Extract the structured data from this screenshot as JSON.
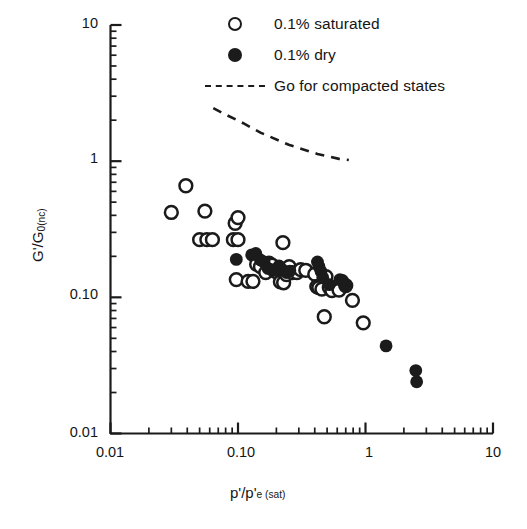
{
  "legend": {
    "position": "top-center",
    "items": [
      {
        "key": "open-circle",
        "label": "0.1% saturated"
      },
      {
        "key": "filled-circle",
        "label": "0.1% dry"
      },
      {
        "key": "dashed-line",
        "label": "Go for compacted states"
      }
    ]
  },
  "axes": {
    "y": {
      "label_html": "G'/G<sub>0(nc)</sub>",
      "label_plain": "G'/G0(nc)",
      "scale": "log",
      "min": 0.01,
      "max": 10,
      "tick_labels": [
        "10",
        "1",
        "0.10",
        "0.01"
      ],
      "tick_values": [
        10,
        1,
        0.1,
        0.01
      ]
    },
    "x": {
      "label_html": "p'/p'<sub>e (sat)</sub>",
      "label_plain": "p'/p'e (sat)",
      "scale": "log",
      "min": 0.01,
      "max": 10,
      "tick_labels": [
        "0.01",
        "0.10",
        "1",
        "10"
      ],
      "tick_values": [
        0.01,
        0.1,
        1,
        10
      ]
    }
  },
  "colors": {
    "axis": "#1b1b1b",
    "marker": "#1b1b1b",
    "background": "#ffffff"
  },
  "chart_data": {
    "type": "scatter",
    "title": "",
    "xlabel": "p'/p'e (sat)",
    "ylabel": "G'/G0(nc)",
    "xscale": "log",
    "yscale": "log",
    "xlim": [
      0.01,
      10
    ],
    "ylim": [
      0.01,
      10
    ],
    "grid": false,
    "legend_position": "top-center",
    "series": [
      {
        "name": "0.1% saturated",
        "marker": "open-circle",
        "points": [
          [
            0.03,
            0.42
          ],
          [
            0.039,
            0.66
          ],
          [
            0.055,
            0.43
          ],
          [
            0.05,
            0.265
          ],
          [
            0.057,
            0.265
          ],
          [
            0.063,
            0.265
          ],
          [
            0.095,
            0.35
          ],
          [
            0.1,
            0.385
          ],
          [
            0.092,
            0.265
          ],
          [
            0.1,
            0.265
          ],
          [
            0.097,
            0.135
          ],
          [
            0.12,
            0.131
          ],
          [
            0.131,
            0.131
          ],
          [
            0.14,
            0.175
          ],
          [
            0.15,
            0.168
          ],
          [
            0.165,
            0.152
          ],
          [
            0.175,
            0.178
          ],
          [
            0.185,
            0.172
          ],
          [
            0.195,
            0.156
          ],
          [
            0.205,
            0.152
          ],
          [
            0.215,
            0.13
          ],
          [
            0.228,
            0.128
          ],
          [
            0.24,
            0.147
          ],
          [
            0.225,
            0.252
          ],
          [
            0.252,
            0.168
          ],
          [
            0.268,
            0.152
          ],
          [
            0.29,
            0.152
          ],
          [
            0.31,
            0.16
          ],
          [
            0.34,
            0.158
          ],
          [
            0.4,
            0.148
          ],
          [
            0.415,
            0.12
          ],
          [
            0.43,
            0.118
          ],
          [
            0.455,
            0.115
          ],
          [
            0.49,
            0.142
          ],
          [
            0.52,
            0.118
          ],
          [
            0.545,
            0.112
          ],
          [
            0.62,
            0.113
          ],
          [
            0.7,
            0.122
          ],
          [
            0.475,
            0.072
          ],
          [
            0.79,
            0.095
          ],
          [
            0.96,
            0.065
          ]
        ]
      },
      {
        "name": "0.1% dry",
        "marker": "filled-circle",
        "points": [
          [
            0.097,
            0.19
          ],
          [
            0.128,
            0.205
          ],
          [
            0.138,
            0.21
          ],
          [
            0.15,
            0.188
          ],
          [
            0.16,
            0.182
          ],
          [
            0.172,
            0.163
          ],
          [
            0.182,
            0.16
          ],
          [
            0.196,
            0.158
          ],
          [
            0.21,
            0.17
          ],
          [
            0.222,
            0.16
          ],
          [
            0.24,
            0.152
          ],
          [
            0.255,
            0.156
          ],
          [
            0.42,
            0.182
          ],
          [
            0.432,
            0.168
          ],
          [
            0.448,
            0.155
          ],
          [
            0.462,
            0.14
          ],
          [
            0.52,
            0.124
          ],
          [
            0.63,
            0.135
          ],
          [
            0.66,
            0.133
          ],
          [
            0.69,
            0.122
          ],
          [
            1.45,
            0.044
          ],
          [
            2.48,
            0.029
          ],
          [
            2.52,
            0.024
          ]
        ]
      }
    ],
    "reference_line": {
      "name": "Go for compacted states",
      "style": "dashed",
      "points": [
        [
          0.064,
          2.45
        ],
        [
          0.08,
          2.2
        ],
        [
          0.11,
          1.9
        ],
        [
          0.15,
          1.62
        ],
        [
          0.25,
          1.32
        ],
        [
          0.42,
          1.13
        ],
        [
          0.62,
          1.04
        ],
        [
          0.74,
          1.02
        ]
      ]
    }
  }
}
